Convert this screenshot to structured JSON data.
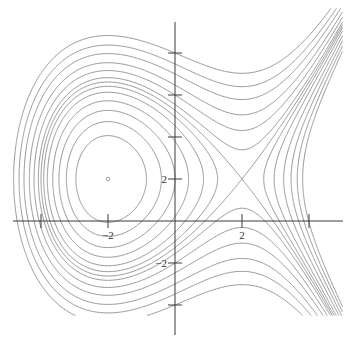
{
  "chart_data": {
    "type": "contour",
    "title": "",
    "xlabel": "",
    "ylabel": "",
    "xlim": [
      -5.2,
      5.0
    ],
    "ylim": [
      -4.5,
      10.5
    ],
    "grid": false,
    "legend": null,
    "x_ticks": [
      -4,
      -2,
      2,
      4
    ],
    "x_tick_labels": [
      "",
      "-2",
      "2",
      ""
    ],
    "y_ticks": [
      -4,
      -2,
      2,
      4,
      6,
      8
    ],
    "y_tick_labels": [
      "",
      "-2",
      "2",
      "",
      "",
      ""
    ],
    "critical_points": [
      {
        "type": "center",
        "x": -2,
        "y": 2,
        "marker": "small-circle"
      },
      {
        "type": "saddle",
        "x": 2,
        "y": 2
      }
    ],
    "levels": [
      -3.2,
      -1.6,
      0.0,
      1.6,
      3.2,
      4.4,
      5.333,
      6.3,
      8.0,
      10.0,
      12.5,
      15.0,
      18.0
    ],
    "line_color": "#8a8a8a",
    "axis_color": "#3a3a3a"
  },
  "axes": {
    "origin_px": [
      175,
      221
    ],
    "px_per_unit_x": 33.5,
    "px_per_unit_y": 21,
    "x_axis_extent_px": [
      13,
      343
    ],
    "y_axis_extent_px": [
      22,
      335
    ]
  }
}
